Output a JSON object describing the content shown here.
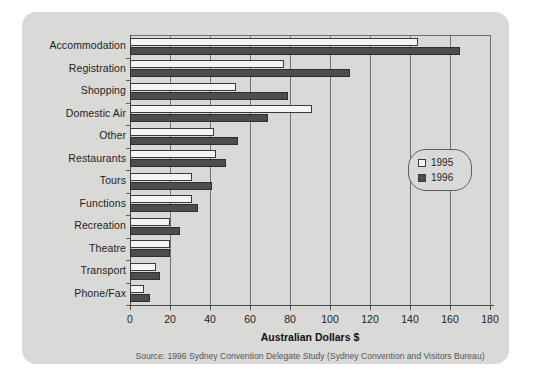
{
  "chart_data": {
    "type": "bar",
    "orientation": "horizontal",
    "title": "",
    "xlabel": "Australian Dollars $",
    "ylabel": "",
    "xlim": [
      0,
      180
    ],
    "xticks": [
      0,
      20,
      40,
      60,
      80,
      100,
      120,
      140,
      160,
      180
    ],
    "grid": true,
    "grid_axis": "x",
    "legend_position": "center-right",
    "categories": [
      "Accommodation",
      "Registration",
      "Shopping",
      "Domestic Air",
      "Other",
      "Restaurants",
      "Tours",
      "Functions",
      "Recreation",
      "Theatre",
      "Transport",
      "Phone/Fax"
    ],
    "series": [
      {
        "name": "1995",
        "color": "#f4f4f2",
        "values": [
          144,
          77,
          53,
          91,
          42,
          43,
          31,
          31,
          20,
          20,
          13,
          7
        ]
      },
      {
        "name": "1996",
        "color": "#4d4d4d",
        "values": [
          165,
          110,
          79,
          69,
          54,
          48,
          41,
          34,
          25,
          20,
          15,
          10
        ]
      }
    ],
    "source_note": "Source: 1996 Sydney Convention Delegate Study (Sydney Convention and Visitors Bureau)"
  },
  "legend": {
    "items": [
      {
        "label": "1995",
        "swatch": "open-square-swatch"
      },
      {
        "label": "1996",
        "swatch": "filled-square-swatch"
      }
    ]
  },
  "colors": {
    "panel_background": "#d9d9d7",
    "page_background": "#ffffff",
    "axis": "#4a4a4a",
    "gridline": "#6f6f6f",
    "series_1995": "#f4f4f2",
    "series_1996": "#4d4d4d",
    "text": "#1d1d1d",
    "source_text": "#555555"
  }
}
